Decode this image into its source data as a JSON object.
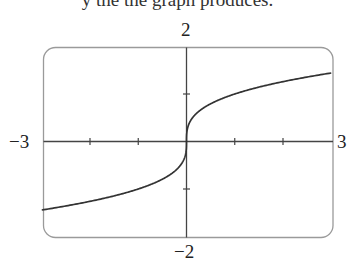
{
  "caption": "y   the   the   graph  produces.",
  "chart_data": {
    "type": "line",
    "title": "",
    "function": "y = x^(1/3)",
    "xlabel": "",
    "ylabel": "",
    "xlim": [
      -3,
      3
    ],
    "ylim": [
      -2,
      2
    ],
    "x_ticks": [
      -2,
      -1,
      1,
      2
    ],
    "y_ticks": [
      -1,
      1
    ],
    "grid": false,
    "window_labels": {
      "xmin": "−3",
      "xmax": "3",
      "ymin": "−2",
      "ymax": "2"
    },
    "series": [
      {
        "name": "cube root",
        "x": [
          -3,
          -2.5,
          -2,
          -1.5,
          -1,
          -0.5,
          -0.2,
          -0.05,
          0,
          0.05,
          0.2,
          0.5,
          1,
          1.5,
          2,
          2.5,
          3
        ],
        "y": [
          -1.442,
          -1.357,
          -1.26,
          -1.145,
          -1,
          -0.794,
          -0.585,
          -0.368,
          0,
          0.368,
          0.585,
          0.794,
          1,
          1.145,
          1.26,
          1.357,
          1.442
        ]
      }
    ]
  },
  "colors": {
    "frame": "#9a9a9a",
    "axes": "#444444",
    "curve": "#333333"
  }
}
